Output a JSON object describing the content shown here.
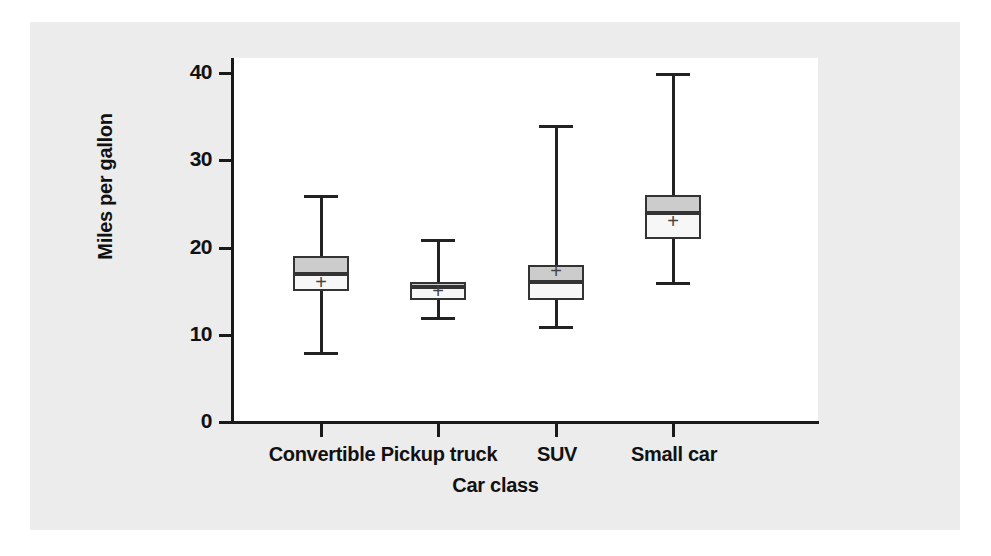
{
  "chart_data": {
    "type": "box",
    "title": "",
    "xlabel": "Car class",
    "ylabel": "Miles per gallon",
    "categories": [
      "Convertible",
      "Pickup truck",
      "SUV",
      "Small car"
    ],
    "ylim": [
      0,
      40
    ],
    "yticks": [
      0,
      10,
      20,
      30,
      40
    ],
    "ytick_labels": [
      "0",
      "10",
      "20",
      "30",
      "40"
    ],
    "grid": false,
    "legend": false,
    "boxes": [
      {
        "category": "Convertible",
        "whisker_low": 8,
        "q1": 15,
        "median": 17,
        "q3": 19,
        "whisker_high": 26,
        "mean": 16
      },
      {
        "category": "Pickup truck",
        "whisker_low": 12,
        "q1": 14,
        "median": 15.5,
        "q3": 16,
        "whisker_high": 21,
        "mean": 15
      },
      {
        "category": "SUV",
        "whisker_low": 11,
        "q1": 14,
        "median": 16,
        "q3": 18,
        "whisker_high": 34,
        "mean": 17.3
      },
      {
        "category": "Small car",
        "whisker_low": 16,
        "q1": 21,
        "median": 24,
        "q3": 26,
        "whisker_high": 40,
        "mean": 23
      }
    ],
    "mean_marker_symbol": "+",
    "colors": {
      "box_upper_fill": "#cccccc",
      "box_lower_fill": "#f7f7f7",
      "box_outline": "#333333",
      "whisker": "#222222",
      "axis": "#1a1a1a",
      "plot_background": "#ffffff",
      "page_background": "#ececec"
    }
  },
  "axis": {
    "y_title": "Miles per gallon",
    "x_title": "Car class",
    "y_labels": [
      "40",
      "30",
      "20",
      "10",
      "0"
    ],
    "x_labels": [
      "Convertible",
      "Pickup truck",
      "SUV",
      "Small car"
    ]
  }
}
